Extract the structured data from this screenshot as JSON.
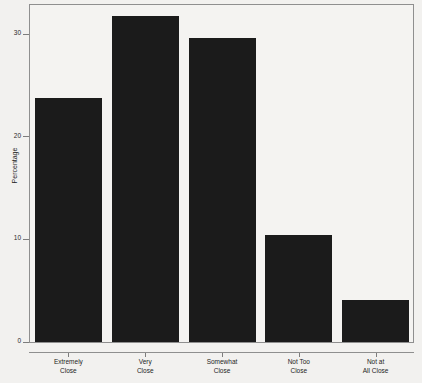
{
  "chart_data": {
    "type": "bar",
    "title": "",
    "subtitle": "",
    "xlabel": "",
    "ylabel": "Percentage",
    "categories": [
      "Extremely Close",
      "Very Close",
      "Somewhat Close",
      "Not Too Close",
      "Not at All Close"
    ],
    "category_lines": [
      [
        "Extremely",
        "Close"
      ],
      [
        "Very",
        "Close"
      ],
      [
        "Somewhat",
        "Close"
      ],
      [
        "Not Too",
        "Close"
      ],
      [
        "Not at",
        "All Close"
      ]
    ],
    "values": [
      23.7,
      31.7,
      29.6,
      10.4,
      4.0
    ],
    "ylim": [
      0,
      32.8
    ],
    "yticks": [
      0,
      10,
      20,
      30
    ],
    "ytick_labels": [
      "0",
      "10",
      "20",
      "30"
    ],
    "grid": false,
    "legend": false,
    "legend_position": "none",
    "bar_color": "#1b1b1b",
    "background_color": "#f2f1ef",
    "frame_color": "#8f8f8f"
  }
}
